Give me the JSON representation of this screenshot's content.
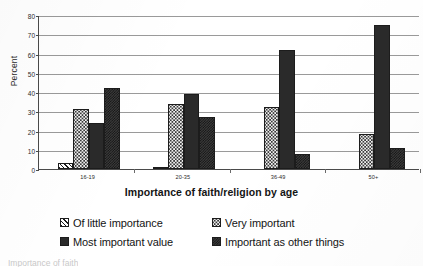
{
  "chart_data": {
    "type": "bar",
    "title": "",
    "xlabel": "Importance of faith/religion by age",
    "ylabel": "Percent",
    "categories": [
      "16-19",
      "20-35",
      "36-49",
      "50+"
    ],
    "ylim": [
      0,
      80
    ],
    "yticks": [
      0,
      10,
      20,
      30,
      40,
      50,
      60,
      70,
      80
    ],
    "grid": true,
    "legend_position": "bottom",
    "series": [
      {
        "name": "Of little importance",
        "pattern": "diagonal-hatch",
        "values": [
          3,
          1,
          0,
          0
        ]
      },
      {
        "name": "Very important",
        "pattern": "light-dots",
        "values": [
          31,
          34,
          32,
          18
        ]
      },
      {
        "name": "Most important value",
        "pattern": "solid-dark",
        "values": [
          24,
          39,
          62,
          75
        ]
      },
      {
        "name": "Important as other things",
        "pattern": "dark-check",
        "values": [
          42,
          27,
          8,
          11
        ]
      }
    ]
  },
  "legend": {
    "entries": [
      "Of little importance",
      "Very important",
      "Most important value",
      "Important as other things"
    ]
  },
  "caption": {
    "cut_text": "Importance of faith"
  },
  "colors": {
    "axis": "#4a4a4a",
    "grid": "#9a9a9a",
    "bar_outline": "#1c1c1c",
    "solid_fill": "#2a2a2a",
    "check_fill": "#3b3b3b",
    "dots_fill": "#f2f2f2",
    "text": "#141414"
  }
}
